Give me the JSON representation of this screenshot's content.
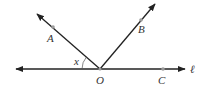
{
  "diagram": {
    "type": "geometry-angles",
    "vertex": {
      "label": "O",
      "x": 100,
      "y": 69
    },
    "line": {
      "label": "ℓ",
      "from": [
        14,
        69
      ],
      "to": [
        187,
        69
      ]
    },
    "rays": [
      {
        "name": "OA",
        "to": [
          36,
          13
        ],
        "point": {
          "label": "A",
          "x": 53,
          "y": 27
        }
      },
      {
        "name": "OB",
        "to": [
          156,
          3
        ],
        "point": {
          "label": "B",
          "x": 141,
          "y": 20
        }
      }
    ],
    "points": [
      {
        "label": "C",
        "x": 163,
        "y": 69
      }
    ],
    "angle": {
      "label": "x",
      "between": [
        "OA",
        "line-left"
      ]
    }
  },
  "labels": {
    "A": "A",
    "B": "B",
    "C": "C",
    "O": "O",
    "x": "x",
    "l": "ℓ"
  },
  "colors": {
    "line": "#222222",
    "point": "#9a9a9a",
    "text": "#333333"
  }
}
